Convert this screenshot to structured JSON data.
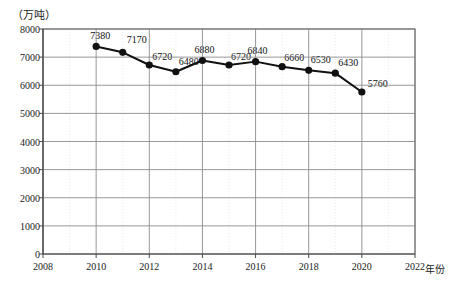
{
  "chart_data": {
    "type": "line",
    "title": "",
    "unit_label": "（万吨）",
    "xlabel": "年份",
    "ylabel": "",
    "x": [
      2010,
      2011,
      2012,
      2013,
      2014,
      2015,
      2016,
      2017,
      2018,
      2019,
      2020
    ],
    "values": [
      7380,
      7170,
      6720,
      6480,
      6880,
      6720,
      6840,
      6660,
      6530,
      6430,
      5760
    ],
    "point_labels": [
      "7380",
      "7170",
      "6720",
      "6480",
      "6880",
      "6720",
      "6840",
      "6660",
      "6530",
      "6430",
      "5760"
    ],
    "xlim": [
      2008,
      2022
    ],
    "ylim": [
      0,
      8000
    ],
    "x_ticks": [
      2008,
      2010,
      2012,
      2014,
      2016,
      2018,
      2020,
      2022
    ],
    "x_tick_labels": [
      "2008",
      "2010",
      "2012",
      "2014",
      "2016",
      "2018",
      "2020",
      "2022"
    ],
    "y_ticks": [
      0,
      1000,
      2000,
      3000,
      4000,
      5000,
      6000,
      7000,
      8000
    ],
    "y_tick_labels": [
      "0",
      "1000",
      "2000",
      "3000",
      "4000",
      "5000",
      "6000",
      "7000",
      "8000"
    ],
    "grid": true,
    "legend": "none",
    "series_color": "#111111",
    "grid_color": "#8c8c8c",
    "marker": "filled-circle"
  }
}
